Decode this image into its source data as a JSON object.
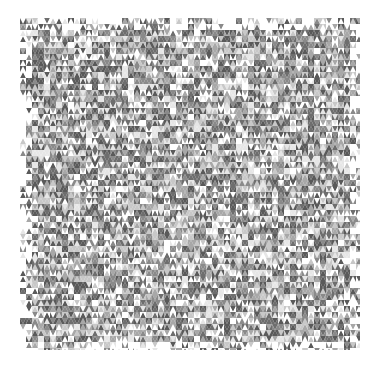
{
  "image": {
    "description": "Generative grayscale triangle mosaic pattern on white background",
    "background": "#ffffff",
    "palette": [
      "#ffffff",
      "#e6e6e6",
      "#c8c8c8",
      "#a8a8a8",
      "#8a8a8a",
      "#6e6e6e",
      "#5a5a5a"
    ],
    "bounds": {
      "x": 20,
      "y": 18,
      "width": 340,
      "height": 332
    },
    "cell": {
      "width": 6,
      "height": 6
    }
  }
}
